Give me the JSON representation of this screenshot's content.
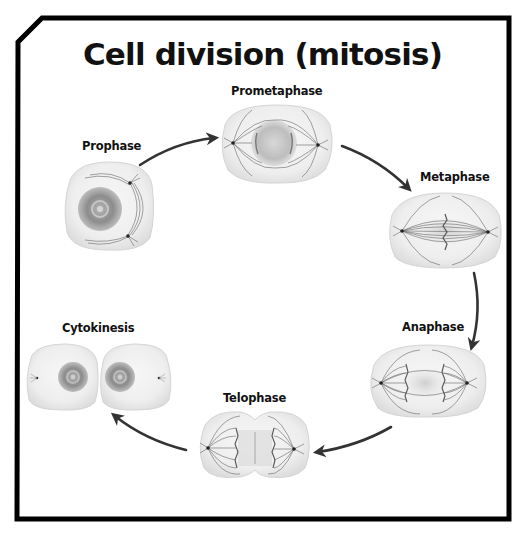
{
  "title": "Cell division (mitosis)",
  "colors": {
    "frame": "#000000",
    "background": "#ffffff",
    "cell_fill": "#ececec",
    "cell_edge": "#d6d6d6",
    "spindle": "#555555",
    "pole": "#222222",
    "nucleus": "#8a8a8a",
    "arrow": "#333333"
  },
  "stages": [
    {
      "id": "prophase",
      "label": "Prophase",
      "order": 1
    },
    {
      "id": "prometaphase",
      "label": "Prometaphase",
      "order": 2
    },
    {
      "id": "metaphase",
      "label": "Metaphase",
      "order": 3
    },
    {
      "id": "anaphase",
      "label": "Anaphase",
      "order": 4
    },
    {
      "id": "telophase",
      "label": "Telophase",
      "order": 5
    },
    {
      "id": "cytokinesis",
      "label": "Cytokinesis",
      "order": 6
    }
  ],
  "arrows": [
    {
      "from": "prophase",
      "to": "prometaphase"
    },
    {
      "from": "prometaphase",
      "to": "metaphase"
    },
    {
      "from": "metaphase",
      "to": "anaphase"
    },
    {
      "from": "anaphase",
      "to": "telophase"
    },
    {
      "from": "telophase",
      "to": "cytokinesis"
    }
  ]
}
